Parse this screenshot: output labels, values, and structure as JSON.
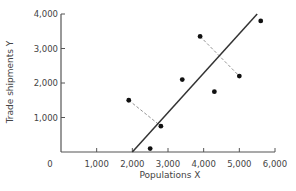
{
  "chart_data": {
    "type": "scatter",
    "title": "",
    "xlabel": "Populations X",
    "ylabel": "Trade shipments Y",
    "xlim": [
      0,
      6000
    ],
    "ylim": [
      0,
      4000
    ],
    "x_ticks": [
      "0",
      "1,000",
      "2,000",
      "3,000",
      "4,000",
      "5,000",
      "6,000"
    ],
    "y_ticks": [
      "1,000",
      "2,000",
      "3,000",
      "4,000"
    ],
    "grid": false,
    "legend": null,
    "points": [
      {
        "x": 1900,
        "y": 1500
      },
      {
        "x": 2500,
        "y": 100
      },
      {
        "x": 2800,
        "y": 750
      },
      {
        "x": 3400,
        "y": 2100
      },
      {
        "x": 3900,
        "y": 3350
      },
      {
        "x": 4300,
        "y": 1750
      },
      {
        "x": 5000,
        "y": 2200
      },
      {
        "x": 5600,
        "y": 3800
      }
    ],
    "regression_line": {
      "x1": 2000,
      "y1": 0,
      "x2": 5500,
      "y2": 4000
    },
    "perpendicular_residuals": [
      {
        "from": {
          "x": 1900,
          "y": 1500
        },
        "to": {
          "x": 2800,
          "y": 750
        },
        "style": "dashed"
      },
      {
        "from": {
          "x": 3900,
          "y": 3350
        },
        "to": {
          "x": 5000,
          "y": 2200
        },
        "style": "dashed"
      }
    ]
  }
}
